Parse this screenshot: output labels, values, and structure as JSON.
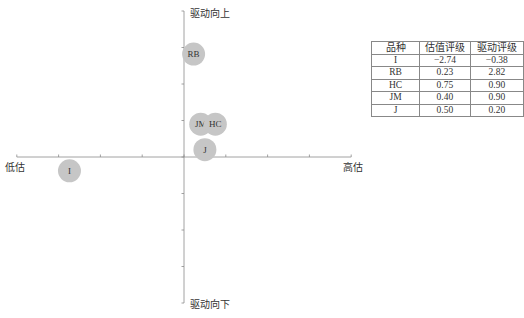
{
  "chart_data": {
    "type": "scatter",
    "title": "",
    "xlabel_left": "低估",
    "xlabel_right": "高估",
    "ylabel_top": "驱动向上",
    "ylabel_bottom": "驱动向下",
    "xlim": [
      -4,
      4
    ],
    "ylim": [
      -4,
      4
    ],
    "grid": false,
    "points": [
      {
        "label": "I",
        "x": -2.74,
        "y": -0.38
      },
      {
        "label": "RB",
        "x": 0.23,
        "y": 2.82
      },
      {
        "label": "HC",
        "x": 0.75,
        "y": 0.9
      },
      {
        "label": "JM",
        "x": 0.4,
        "y": 0.9
      },
      {
        "label": "J",
        "x": 0.5,
        "y": 0.2
      }
    ],
    "bubble_color": "#c6c6c6"
  },
  "axes": {
    "left_label": "低估",
    "right_label": "高估",
    "top_label": "驱动向上",
    "bottom_label": "驱动向下"
  },
  "table": {
    "headers": [
      "品种",
      "估值评级",
      "驱动评级"
    ],
    "rows": [
      [
        "I",
        "−2.74",
        "−0.38"
      ],
      [
        "RB",
        "0.23",
        "2.82"
      ],
      [
        "HC",
        "0.75",
        "0.90"
      ],
      [
        "JM",
        "0.40",
        "0.90"
      ],
      [
        "J",
        "0.50",
        "0.20"
      ]
    ]
  }
}
